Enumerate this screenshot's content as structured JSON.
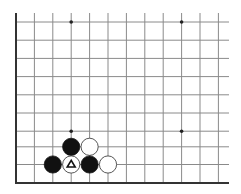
{
  "diagram": {
    "type": "go-board-partial",
    "colors": {
      "background": "#ffffff",
      "grid_line": "#8a8a8a",
      "edge_line": "#333333",
      "black_stone": "#111111",
      "white_stone_fill": "#ffffff",
      "white_stone_stroke": "#444444",
      "star_point": "#222222",
      "marker": "#111111"
    },
    "grid": {
      "columns_x": [
        16,
        34.4,
        52.8,
        71.2,
        89.6,
        108,
        126.4,
        144.8,
        163.2,
        181.6,
        200,
        218.4
      ],
      "rows_y": [
        22,
        40.2,
        58.4,
        76.6,
        94.8,
        113,
        131.2,
        146.8,
        164.5
      ],
      "edge_left_x": 16,
      "edge_bottom_y": 183,
      "top_y": 13,
      "right_x": 229
    },
    "star_points": [
      {
        "col": 3,
        "row": 0
      },
      {
        "col": 9,
        "row": 0
      },
      {
        "col": 3,
        "row": 6
      },
      {
        "col": 9,
        "row": 6
      }
    ],
    "stones": [
      {
        "color": "black",
        "col": 3,
        "row": 7
      },
      {
        "color": "white",
        "col": 4,
        "row": 7
      },
      {
        "color": "black",
        "col": 2,
        "row": 8
      },
      {
        "color": "white",
        "col": 3,
        "row": 8,
        "marker": "triangle"
      },
      {
        "color": "black",
        "col": 4,
        "row": 8
      },
      {
        "color": "white",
        "col": 5,
        "row": 8
      }
    ],
    "stone_radius": 8.6
  }
}
